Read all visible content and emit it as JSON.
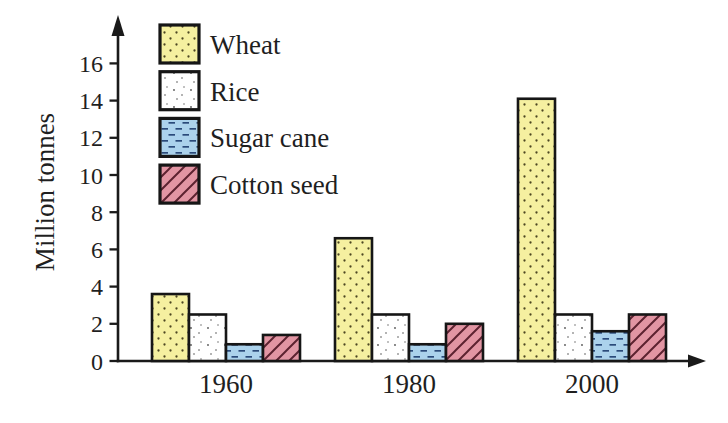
{
  "figure": {
    "background": "#ffffff"
  },
  "chart_data": {
    "type": "bar",
    "title": "",
    "xlabel": "",
    "ylabel": "Million tonnes",
    "categories": [
      "1960",
      "1980",
      "2000"
    ],
    "series": [
      {
        "name": "Wheat",
        "values": [
          3.6,
          6.6,
          14.1
        ],
        "fill": "#f5f0a0",
        "pattern": "diagonal-dot-rows",
        "pattern_color": "#4d4722"
      },
      {
        "name": "Rice",
        "values": [
          2.5,
          2.5,
          2.5
        ],
        "fill": "#ffffff",
        "pattern": "sparse-dots",
        "pattern_color": "#555555"
      },
      {
        "name": "Sugar cane",
        "values": [
          0.9,
          0.9,
          1.6
        ],
        "fill": "#abd2ec",
        "pattern": "horizontal-dashes",
        "pattern_color": "#2a4a7a"
      },
      {
        "name": "Cotton seed",
        "values": [
          1.4,
          2.0,
          2.5
        ],
        "fill": "#e295a3",
        "pattern": "diagonal-lines",
        "pattern_color": "#5d2230"
      }
    ],
    "ylim": [
      0,
      16
    ],
    "yticks": [
      0,
      2,
      4,
      6,
      8,
      10,
      12,
      14,
      16
    ],
    "grid": false,
    "legend_position": "top-left-inside",
    "axis_color": "#1a1a1a",
    "bar_border_color": "#161616",
    "text_color": "#1f1f1f"
  }
}
